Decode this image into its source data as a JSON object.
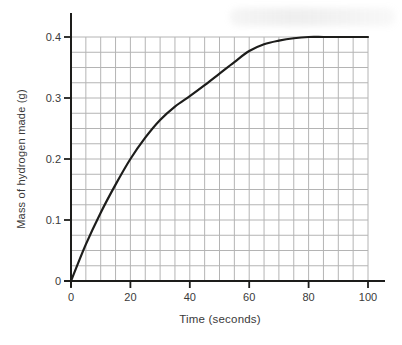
{
  "figure": {
    "xlabel": "Time (seconds)",
    "ylabel": "Mass of hydrogen made (g)"
  },
  "chart_data": {
    "type": "line",
    "title": "",
    "xlabel": "Time (seconds)",
    "ylabel": "Mass of hydrogen made (g)",
    "xlim": [
      0,
      100
    ],
    "ylim": [
      0,
      0.4
    ],
    "x_ticks": [
      0,
      20,
      40,
      60,
      80,
      100
    ],
    "y_ticks": [
      0,
      0.1,
      0.2,
      0.3,
      0.4
    ],
    "minor_grid_step_x": 5,
    "minor_grid_step_y": 0.025,
    "grid": true,
    "legend": false,
    "series": [
      {
        "name": "mass of hydrogen made",
        "x": [
          0,
          5,
          10,
          15,
          20,
          25,
          30,
          35,
          40,
          45,
          50,
          55,
          60,
          65,
          70,
          75,
          80,
          85,
          90,
          95,
          100
        ],
        "y": [
          0,
          0.06,
          0.112,
          0.158,
          0.2,
          0.235,
          0.264,
          0.286,
          0.303,
          0.321,
          0.34,
          0.359,
          0.377,
          0.388,
          0.394,
          0.398,
          0.4,
          0.4,
          0.4,
          0.4,
          0.4
        ]
      }
    ],
    "colors": {
      "curve": "#1d1d1b",
      "grid": "#b4b4b4",
      "axis": "#1d1d1b",
      "text": "#3a3a3a",
      "background": "#ffffff"
    }
  }
}
